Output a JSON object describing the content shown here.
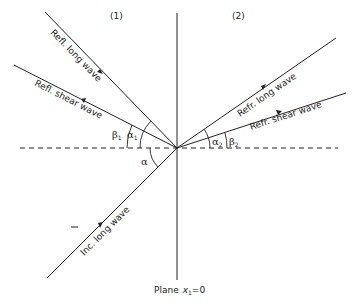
{
  "diagram": {
    "regions": {
      "left": "(1)",
      "right": "(2)"
    },
    "waves": {
      "incident_long": "Inc. long wave",
      "reflected_long": "Refl. long wave",
      "reflected_shear": "Refl. shear wave",
      "refracted_long": "Refr. long wave",
      "refracted_shear": "Refr. shear wave"
    },
    "angles": {
      "incident": "α",
      "refl_long": "α",
      "refl_long_sub": "1",
      "refl_shear": "β",
      "refl_shear_sub": "1",
      "refr_long": "α",
      "refr_long_sub": "2",
      "refr_shear": "β",
      "refr_shear_sub": "2"
    },
    "plane_label": {
      "prefix": "Plane",
      "var": "x",
      "sub": "1",
      "suffix": "=0"
    },
    "stray_mark": "–"
  }
}
